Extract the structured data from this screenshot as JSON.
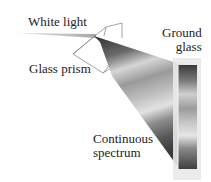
{
  "figure": {
    "labels": {
      "white_light": "White light",
      "glass_prism": "Glass prism",
      "ground_glass": "Ground\nglass",
      "continuous_spectrum": "Continuous\nspectrum"
    },
    "colors": {
      "background": "#ffffff",
      "text": "#222222",
      "prism_outline": "#8a8a8a",
      "beam_dark": "#3a3a3a",
      "beam_light": "#d8d8d8",
      "glass_frame": "#e6e6e6",
      "incoming_beam": "#b8b8b8"
    }
  }
}
